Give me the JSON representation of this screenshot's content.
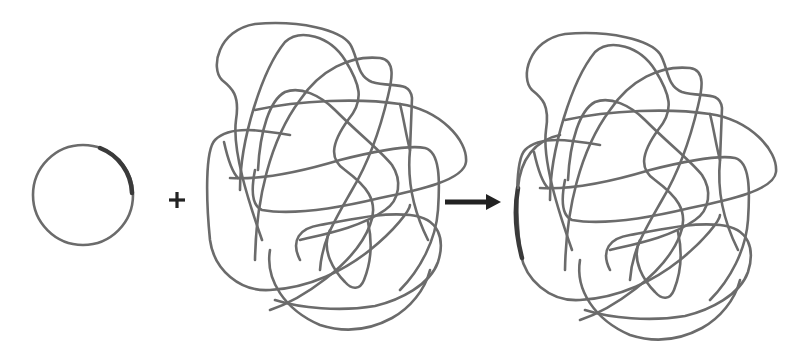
{
  "diagram": {
    "components": [
      {
        "id": "plasmid",
        "label": "",
        "shape": "circle",
        "center": [
          83,
          195
        ],
        "radius": 50,
        "marked_segment": "upper-right arc"
      },
      {
        "id": "plus",
        "symbol": "+",
        "position": [
          177,
          200
        ]
      },
      {
        "id": "chromosome",
        "label": "",
        "shape": "tangled loop",
        "bbox": [
          205,
          15,
          470,
          320
        ]
      },
      {
        "id": "reaction-arrow",
        "symbol": "→",
        "from": [
          445,
          202
        ],
        "to": [
          500,
          202
        ]
      },
      {
        "id": "recombinant-chromosome",
        "label": "",
        "shape": "tangled loop",
        "bbox": [
          515,
          25,
          780,
          330
        ],
        "marked_segment": "left edge"
      }
    ],
    "colors": {
      "background": "#ffffff",
      "strand": "#6b6b6b",
      "marked_segment": "#3a3a3a",
      "symbols": "#222222"
    },
    "symbols": {
      "plus": "+",
      "arrow": "→"
    }
  }
}
